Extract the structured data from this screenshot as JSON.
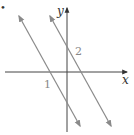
{
  "diagram": {
    "axes": {
      "x_label": "x",
      "y_label": "y"
    },
    "lines": [
      {
        "id": 1,
        "label": "1"
      },
      {
        "id": 2,
        "label": "2"
      }
    ],
    "colors": {
      "axis": "#333333",
      "line": "#8a8a8a",
      "label": "#888888"
    },
    "marker": "•"
  }
}
